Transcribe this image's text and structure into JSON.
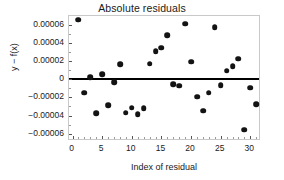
{
  "chart_data": {
    "type": "scatter",
    "title": "Absolute residuals",
    "xlabel": "Index of residual",
    "ylabel": "y − f(x)",
    "grid": false,
    "legend": null,
    "xlim": [
      -0.6,
      31.8
    ],
    "ylim": [
      -6.8e-05,
      6.95e-05
    ],
    "xticks": [
      0,
      5,
      10,
      15,
      20,
      25,
      30
    ],
    "xtick_labels": [
      "0",
      "5",
      "10",
      "15",
      "20",
      "25",
      "30"
    ],
    "yticks": [
      6e-05,
      4e-05,
      2e-05,
      0,
      -2e-05,
      -4e-05,
      -6e-05
    ],
    "ytick_labels": [
      "0.00006",
      "0.00004",
      "0.00002",
      "0",
      "−0.00002",
      "−0.00004",
      "−0.00006"
    ],
    "reference_line": {
      "y": 0,
      "style": "solid",
      "color": "#000000"
    },
    "marker": {
      "shape": "circle",
      "color": "#131313",
      "size": 5.6
    },
    "x": [
      1,
      2,
      3,
      4,
      5,
      6,
      7,
      8,
      9,
      10,
      11,
      12,
      13,
      14,
      15,
      16,
      17,
      18,
      19,
      20,
      21,
      22,
      23,
      24,
      25,
      26,
      27,
      28,
      29,
      30,
      31
    ],
    "values": [
      6.53e-05,
      -1.48e-05,
      2.3e-06,
      -3.72e-05,
      5.2e-06,
      -2.89e-05,
      -3.6e-06,
      1.62e-05,
      -3.68e-05,
      -3.12e-05,
      -3.86e-05,
      -3.16e-05,
      1.7e-05,
      3.08e-05,
      3.45e-05,
      4.87e-05,
      -5.2e-06,
      -7.2e-06,
      6.09e-05,
      1.91e-05,
      -1.94e-05,
      -3.46e-05,
      -1.49e-05,
      5.73e-05,
      -6.4e-06,
      9.4e-06,
      1.46e-05,
      2.24e-05,
      -5.57e-05,
      -9.5e-06,
      -2.73e-05
    ]
  },
  "figure": {
    "title": "Absolute residuals",
    "xlabel": "Index of residual",
    "ylabel": "y − f(x)"
  }
}
